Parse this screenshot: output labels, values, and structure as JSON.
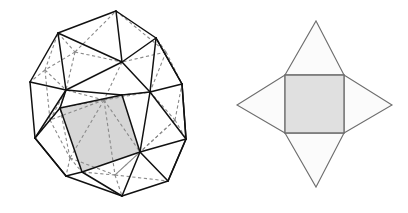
{
  "figure": {
    "background_color": "#ffffff",
    "width": 408,
    "height": 213
  },
  "colors": {
    "visible_edge": "#111111",
    "hidden_edge": "#8a8a8a",
    "shaded_face": "#d6d6d6",
    "net_square_fill": "#e0e0e0",
    "net_square_stroke": "#6e6e6e",
    "net_triangle_fill": "#fbfbfb",
    "net_triangle_stroke": "#6e6e6e"
  },
  "left_figure": {
    "name": "rhombicuboctahedron-wireframe",
    "description": "Wireframe polyhedron drawn with solid black visible edges and gray dashed hidden edges, one square face filled gray",
    "highlighted_face_type": "square",
    "highlighted_face_points": "60,108 122,95 140,152 82,172",
    "visible_edges": [
      "116,11 58,33",
      "58,33 30,82",
      "30,82 35,138",
      "35,138 66,176",
      "66,176 122,196",
      "122,196 168,181",
      "168,181 186,139",
      "186,139 182,84",
      "182,84 156,38",
      "156,38 116,11",
      "58,33 66,90",
      "66,90 30,82",
      "66,90 35,138",
      "66,90 60,108",
      "60,108 35,138",
      "60,108 82,172",
      "82,172 66,176",
      "82,172 122,196",
      "116,11 122,62",
      "122,62 58,33",
      "122,62 66,90",
      "122,62 156,38",
      "122,62 150,92",
      "150,92 156,38",
      "150,92 182,84",
      "150,92 122,95",
      "122,95 66,90",
      "122,95 60,108",
      "122,95 140,152",
      "140,152 150,92",
      "140,152 186,139",
      "140,152 82,172",
      "140,152 168,181",
      "140,152 122,196",
      "150,92 186,139",
      "182,84 186,139",
      "156,38 182,84",
      "66,176 35,138",
      "168,181 186,139"
    ],
    "hidden_edges": [
      "58,33 75,52",
      "75,52 116,11",
      "75,52 122,62",
      "75,52 66,90",
      "75,52 45,70",
      "45,70 30,82",
      "45,70 58,33",
      "45,70 66,90",
      "45,70 50,120",
      "50,120 35,138",
      "50,120 66,90",
      "50,120 60,108",
      "50,120 70,158",
      "70,158 66,176",
      "70,158 82,172",
      "70,158 60,108",
      "70,158 115,175",
      "115,175 122,196",
      "115,175 82,172",
      "115,175 140,152",
      "115,175 168,181",
      "116,11 166,52",
      "166,52 156,38",
      "166,52 122,62",
      "166,52 150,92",
      "166,52 182,84",
      "122,62 104,100",
      "104,100 122,95",
      "104,100 66,90",
      "104,100 60,108",
      "104,100 140,152",
      "104,100 150,92",
      "104,100 50,120",
      "104,100 70,158",
      "104,100 115,175",
      "150,92 175,120",
      "175,120 182,84",
      "175,120 186,139",
      "175,120 140,152",
      "175,120 115,175",
      "122,95 150,92",
      "60,108 66,90"
    ]
  },
  "right_figure": {
    "name": "vertex-net",
    "description": "Net of four triangles attached to the sides of a central square, forming a four-pointed star",
    "square": {
      "label": "central-square",
      "points": "285,75 344,75 344,133 285,133"
    },
    "triangles": [
      {
        "label": "top-triangle",
        "points": "285,75 344,75 316,21"
      },
      {
        "label": "right-triangle",
        "points": "344,75 344,133 392,105"
      },
      {
        "label": "bottom-triangle",
        "points": "285,133 344,133 316,187"
      },
      {
        "label": "left-triangle",
        "points": "285,75 285,133 237,105"
      }
    ]
  }
}
